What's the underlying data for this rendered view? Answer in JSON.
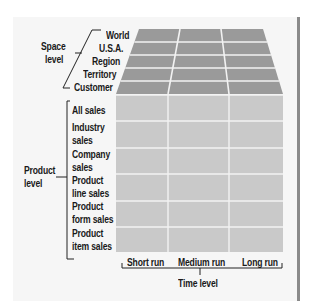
{
  "diagram": {
    "type": "3d-cube-grid",
    "space_level": {
      "title": "Space level",
      "items": [
        "World",
        "U.S.A.",
        "Region",
        "Territory",
        "Customer"
      ]
    },
    "product_level": {
      "title": "Product level",
      "items": [
        "All sales",
        "Industry sales",
        "Company sales",
        "Product line sales",
        "Product form sales",
        "Product item sales"
      ]
    },
    "time_level": {
      "title": "Time level",
      "items": [
        "Short run",
        "Medium run",
        "Long run"
      ]
    },
    "colors": {
      "top_face": "#9a9a9a",
      "front_face": "#c9c9c9",
      "grid_lines": "#f2f2f2",
      "background": "#f6f6f6",
      "border": "#8a8a8a"
    }
  },
  "labels": {
    "space_l1": "Space",
    "space_l2": "level",
    "world": "World",
    "usa": "U.S.A.",
    "region": "Region",
    "territory": "Territory",
    "customer": "Customer",
    "product_l1": "Product",
    "product_l2": "level",
    "all_sales": "All sales",
    "industry_1": "Industry",
    "industry_2": "sales",
    "company_1": "Company",
    "company_2": "sales",
    "pline_1": "Product",
    "pline_2": "line sales",
    "pform_1": "Product",
    "pform_2": "form sales",
    "pitem_1": "Product",
    "pitem_2": "item sales",
    "short_run": "Short run",
    "medium_run": "Medium run",
    "long_run": "Long run",
    "time_level": "Time level"
  }
}
